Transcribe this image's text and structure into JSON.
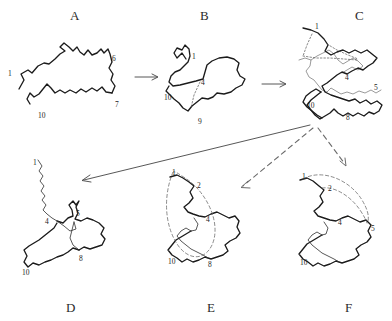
{
  "figure": {
    "type": "protein-folding-pathway-diagram",
    "background_color": "#ffffff",
    "ink_color": "#1b1b1b",
    "secondary_ink_color": "#8e8e8e",
    "dashed_color": "#6a6a6a",
    "width": 392,
    "height": 321
  },
  "panels": [
    {
      "id": "A",
      "letter": "A",
      "letter_position": {
        "x": 70,
        "y": 8
      },
      "caption_side": "top",
      "description": "extended unfolded chain, hairpin-like double strand",
      "residue_labels": [
        {
          "text": "1",
          "x": 8,
          "y": 69
        },
        {
          "text": "6",
          "x": 112,
          "y": 54
        },
        {
          "text": "7",
          "x": 115,
          "y": 100
        },
        {
          "text": "10",
          "x": 38,
          "y": 111
        }
      ]
    },
    {
      "id": "B",
      "letter": "B",
      "letter_position": {
        "x": 200,
        "y": 8
      },
      "caption_side": "top",
      "description": "partially collapsed chain with one closed loop",
      "residue_labels": [
        {
          "text": "1",
          "x": 192,
          "y": 52
        },
        {
          "text": "4",
          "x": 201,
          "y": 78
        },
        {
          "text": "10",
          "x": 164,
          "y": 93
        },
        {
          "text": "9",
          "x": 198,
          "y": 117
        }
      ]
    },
    {
      "id": "C",
      "letter": "C",
      "letter_position": {
        "x": 355,
        "y": 8
      },
      "caption_side": "top",
      "description": "compact intermediate with grey shadow chain and dotted contacts",
      "residue_labels": [
        {
          "text": "1",
          "x": 315,
          "y": 22
        },
        {
          "text": "4",
          "x": 345,
          "y": 73
        },
        {
          "text": "5",
          "x": 374,
          "y": 83
        },
        {
          "text": "10",
          "x": 307,
          "y": 101
        },
        {
          "text": "8",
          "x": 346,
          "y": 113
        }
      ]
    },
    {
      "id": "D",
      "letter": "D",
      "letter_position": {
        "x": 66,
        "y": 300
      },
      "caption_side": "bottom",
      "description": "folded core with long extended N-terminal tail",
      "residue_labels": [
        {
          "text": "1",
          "x": 33,
          "y": 158
        },
        {
          "text": "4",
          "x": 45,
          "y": 217
        },
        {
          "text": "5",
          "x": 76,
          "y": 209
        },
        {
          "text": "8",
          "x": 79,
          "y": 254
        },
        {
          "text": "10",
          "x": 22,
          "y": 268
        }
      ]
    },
    {
      "id": "E",
      "letter": "E",
      "letter_position": {
        "x": 207,
        "y": 300
      },
      "caption_side": "bottom",
      "description": "folded core with dashed elliptical loop closure from 1 to 8",
      "residue_labels": [
        {
          "text": "1",
          "x": 172,
          "y": 168
        },
        {
          "text": "2",
          "x": 197,
          "y": 181
        },
        {
          "text": "4",
          "x": 206,
          "y": 215
        },
        {
          "text": "10",
          "x": 168,
          "y": 257
        },
        {
          "text": "8",
          "x": 208,
          "y": 260
        }
      ]
    },
    {
      "id": "F",
      "letter": "F",
      "letter_position": {
        "x": 345,
        "y": 300
      },
      "caption_side": "bottom",
      "description": "folded core with dashed arc closure from 1 to 5",
      "residue_labels": [
        {
          "text": "1",
          "x": 302,
          "y": 172
        },
        {
          "text": "2",
          "x": 328,
          "y": 184
        },
        {
          "text": "4",
          "x": 338,
          "y": 218
        },
        {
          "text": "5",
          "x": 371,
          "y": 224
        },
        {
          "text": "10",
          "x": 300,
          "y": 258
        }
      ]
    }
  ],
  "arrows": [
    {
      "id": "a-to-b",
      "from": "A",
      "to": "B",
      "style": "solid",
      "orientation": "right"
    },
    {
      "id": "b-to-c",
      "from": "B",
      "to": "C",
      "style": "solid",
      "orientation": "right"
    },
    {
      "id": "c-to-d",
      "from": "C",
      "to": "D",
      "style": "solid",
      "orientation": "down-left"
    },
    {
      "id": "c-to-e",
      "from": "C",
      "to": "E",
      "style": "dashed",
      "orientation": "down-left"
    },
    {
      "id": "c-to-f",
      "from": "C",
      "to": "F",
      "style": "dashed",
      "orientation": "down-right"
    }
  ]
}
